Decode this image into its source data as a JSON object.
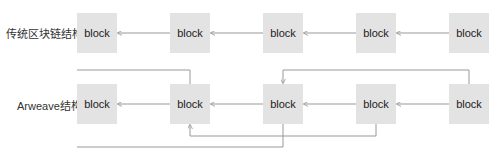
{
  "rows": [
    {
      "label": "传统区块链结构",
      "blocks": [
        "block",
        "block",
        "block",
        "block",
        "block"
      ]
    },
    {
      "label": "Arweave结构",
      "blocks": [
        "block",
        "block",
        "block",
        "block",
        "block"
      ]
    }
  ],
  "colors": {
    "block_fill": "#e3e3e3",
    "line": "#999999",
    "text": "#222222"
  }
}
